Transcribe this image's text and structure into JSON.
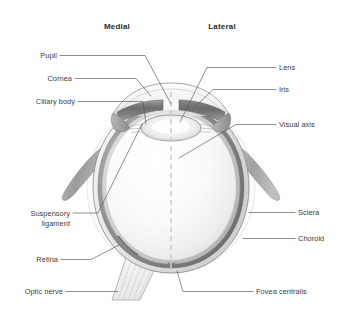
{
  "figure": {
    "width": 341,
    "height": 311,
    "background_color": "#ffffff"
  },
  "orientation_headings": [
    {
      "id": "medial",
      "label": "Medial",
      "x": 117,
      "y": 29
    },
    {
      "id": "lateral",
      "label": "Lateral",
      "x": 222,
      "y": 29
    }
  ],
  "labels": [
    {
      "id": "pupil",
      "label": "Pupil",
      "side": "left",
      "text_x": 57,
      "text_y": 58,
      "anchor": "end",
      "leader": "M 60,55.5 L 145,55.5 L 171,104"
    },
    {
      "id": "cornea",
      "label": "Cornea",
      "side": "left",
      "text_x": 72,
      "text_y": 81,
      "anchor": "end",
      "leader": "M 75,78.5 L 136,78.5 L 151,96"
    },
    {
      "id": "ciliary-body",
      "label": "Ciliary body",
      "side": "left",
      "text_x": 75,
      "text_y": 104,
      "anchor": "end",
      "leader": "M 78,101.5 L 143,101.5 L 146,124"
    },
    {
      "id": "suspensory-ligament",
      "label": "Suspensory",
      "label_line2": "ligament",
      "side": "left",
      "text_x": 70,
      "text_y": 216,
      "text_y2": 226,
      "anchor": "end",
      "leader": "M 73,213 L 98,213 L 142,124"
    },
    {
      "id": "retina",
      "label": "Retina",
      "side": "left",
      "text_x": 58,
      "text_y": 262,
      "anchor": "end",
      "leader": "M 61,259.5 L 91,259.5 L 119,245"
    },
    {
      "id": "optic-nerve",
      "label": "Optic nerve",
      "side": "left",
      "text_x": 63,
      "text_y": 294,
      "anchor": "end",
      "leader": "M 66,291.5 L 118,291.5"
    },
    {
      "id": "lens",
      "label": "Lens",
      "side": "right",
      "text_x": 279,
      "text_y": 70,
      "anchor": "start",
      "leader": "M 276,67.5 L 207,67.5 L 180,122"
    },
    {
      "id": "iris",
      "label": "Iris",
      "side": "right",
      "text_x": 279,
      "text_y": 92,
      "anchor": "start",
      "leader": "M 276,89.5 L 213,89.5 L 196,106"
    },
    {
      "id": "visual-axis",
      "label": "Visual axis",
      "side": "right",
      "text_x": 279,
      "text_y": 127,
      "anchor": "start",
      "leader": "M 276,124.5 L 236,124.5 L 179,158"
    },
    {
      "id": "sclera",
      "label": "Sclera",
      "side": "right",
      "text_x": 298,
      "text_y": 215,
      "anchor": "start",
      "leader": "M 295,212.5 L 249,212.5"
    },
    {
      "id": "choroid",
      "label": "Choroid",
      "side": "right",
      "text_x": 298,
      "text_y": 241,
      "anchor": "start",
      "leader": "M 295,238.5 L 243,238.5"
    },
    {
      "id": "fovea-centralis",
      "label": "Fovea centralis",
      "side": "right",
      "text_x": 256,
      "text_y": 294,
      "anchor": "start",
      "leader": "M 253,291.5 L 183,291.5 L 177,271"
    }
  ],
  "structures": [
    {
      "id": "sclera-wall",
      "name": "Sclera",
      "color": "#e9e9e9"
    },
    {
      "id": "choroid-wall",
      "name": "Choroid",
      "color": "#8c8c8c"
    },
    {
      "id": "retina-wall",
      "name": "Retina",
      "color": "#c9c9c9"
    },
    {
      "id": "vitreous-body",
      "name": "Vitreous humour",
      "color": "#f4f4f4"
    },
    {
      "id": "cornea-dome",
      "name": "Cornea",
      "color": "#f0f0f0"
    },
    {
      "id": "iris-band",
      "name": "Iris",
      "color": "#767676"
    },
    {
      "id": "lens-body",
      "name": "Lens",
      "color": "#ededed"
    },
    {
      "id": "ciliary-body",
      "name": "Ciliary body",
      "color": "#9a9a9a"
    },
    {
      "id": "optic-nerve",
      "name": "Optic nerve",
      "color": "#efefef"
    },
    {
      "id": "rectus-muscle",
      "name": "Extraocular muscle",
      "color": "#a6a6a6"
    },
    {
      "id": "visual-axis",
      "name": "Visual axis",
      "color": "#d2d2d2"
    }
  ],
  "colors": {
    "label_text": "#3b3b3b",
    "heading_text": "#2a2a2a",
    "leader_line": "#555555",
    "outline": "#6f6f6f"
  }
}
